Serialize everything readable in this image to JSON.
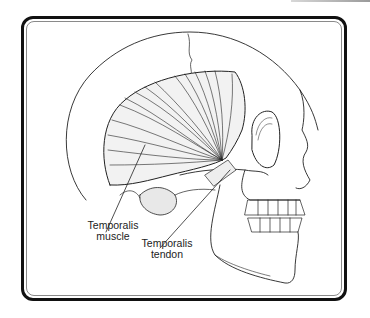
{
  "figure": {
    "labels": [
      {
        "line1": "Temporalis",
        "line2": "muscle"
      },
      {
        "line1": "Temporalis",
        "line2": "tendon"
      }
    ]
  },
  "colors": {
    "frame": "#111111",
    "inner_frame": "#8a8a8a",
    "line_art": "#222222",
    "background": "#ffffff"
  }
}
